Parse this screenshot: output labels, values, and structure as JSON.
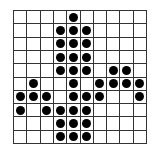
{
  "grid": {
    "rows": 10,
    "cols": 10,
    "line_color": "#333333",
    "dot_color": "#000000",
    "dots": [
      [
        0,
        4
      ],
      [
        1,
        3
      ],
      [
        1,
        4
      ],
      [
        1,
        5
      ],
      [
        2,
        3
      ],
      [
        2,
        4
      ],
      [
        2,
        5
      ],
      [
        3,
        3
      ],
      [
        3,
        4
      ],
      [
        3,
        5
      ],
      [
        4,
        3
      ],
      [
        4,
        4
      ],
      [
        4,
        5
      ],
      [
        4,
        7
      ],
      [
        4,
        8
      ],
      [
        5,
        1
      ],
      [
        5,
        4
      ],
      [
        5,
        6
      ],
      [
        5,
        7
      ],
      [
        5,
        8
      ],
      [
        5,
        9
      ],
      [
        6,
        0
      ],
      [
        6,
        1
      ],
      [
        6,
        2
      ],
      [
        6,
        4
      ],
      [
        6,
        5
      ],
      [
        6,
        6
      ],
      [
        6,
        9
      ],
      [
        7,
        0
      ],
      [
        7,
        2
      ],
      [
        7,
        3
      ],
      [
        7,
        4
      ],
      [
        7,
        5
      ],
      [
        8,
        3
      ],
      [
        8,
        4
      ],
      [
        8,
        5
      ],
      [
        9,
        3
      ],
      [
        9,
        4
      ],
      [
        9,
        5
      ]
    ]
  }
}
